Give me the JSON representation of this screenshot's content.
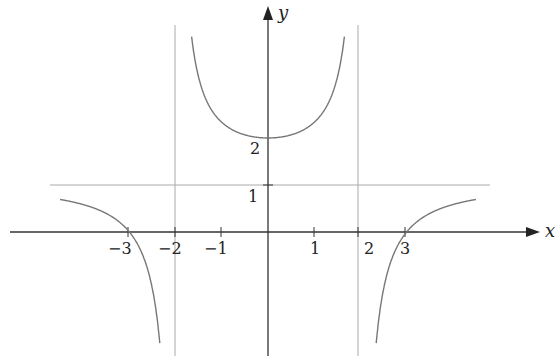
{
  "chart_data": {
    "type": "line",
    "title": "",
    "xlabel": "x",
    "ylabel": "y",
    "function_shape": "rational function with vertical asymptotes x = -2, x = 2 and horizontal asymptote y = 1",
    "x_ticks": [
      "-3",
      "-2",
      "-1",
      "1",
      "2",
      "3"
    ],
    "y_ticks": [
      "1",
      "2"
    ],
    "asymptotes": {
      "vertical": [
        -2,
        2
      ],
      "horizontal": [
        1
      ]
    },
    "key_points": [
      {
        "x": -3,
        "y": 0
      },
      {
        "x": 3,
        "y": 0
      },
      {
        "x": 0,
        "y": 2
      }
    ],
    "series": [
      {
        "name": "left branch",
        "x_range": [
          -4.5,
          -2
        ],
        "behavior": "approaches y=1 from below as x→-∞, crosses x-axis at -3, goes to -∞ as x→-2⁻"
      },
      {
        "name": "middle branch",
        "x_range": [
          -2,
          2
        ],
        "behavior": "U-shaped, minimum at (0, 2), goes to +∞ as x→±2"
      },
      {
        "name": "right branch",
        "x_range": [
          2,
          4.5
        ],
        "behavior": "goes from -∞ at x→2⁺, crosses x-axis at 3, approaches y=1 from below"
      }
    ],
    "grid": false,
    "legend": null
  },
  "labels": {
    "x_axis": "x",
    "y_axis": "y",
    "tick_m3": "−3",
    "tick_m2": "−2",
    "tick_m1": "−1",
    "tick_1": "1",
    "tick_2": "2",
    "tick_3": "3",
    "y_tick_1": "1",
    "y_tick_2": "2"
  },
  "colors": {
    "axis": "#333333",
    "curve": "#777777",
    "asymptote": "#aaaaaa"
  }
}
